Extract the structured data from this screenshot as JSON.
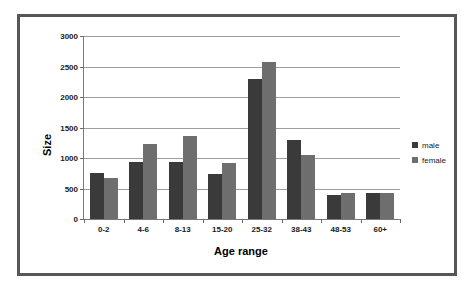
{
  "chart_data": {
    "type": "bar",
    "title": "",
    "xlabel": "Age range",
    "ylabel": "Size",
    "categories": [
      "0-2",
      "4-6",
      "8-13",
      "15-20",
      "25-32",
      "38-43",
      "48-53",
      "60+"
    ],
    "series": [
      {
        "name": "male",
        "color": "#3a3a3a",
        "values": [
          750,
          930,
          940,
          730,
          2300,
          1290,
          390,
          430
        ]
      },
      {
        "name": "female",
        "color": "#6e6e6e",
        "values": [
          680,
          1230,
          1360,
          920,
          2580,
          1050,
          420,
          420
        ]
      }
    ],
    "ylim": [
      0,
      3000
    ],
    "yticks": [
      0,
      500,
      1000,
      1500,
      2000,
      2500,
      3000
    ],
    "ytick_labels": [
      "0",
      "500",
      "1000",
      "1500",
      "2000",
      "2500",
      "3000"
    ],
    "grid": true,
    "legend_position": "right"
  },
  "frame": {
    "border_color": "#575757",
    "background": "#ffffff"
  }
}
